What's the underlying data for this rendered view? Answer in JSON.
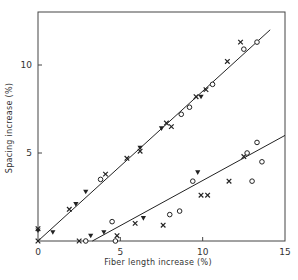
{
  "chart_data": {
    "type": "scatter",
    "title": "",
    "xlabel": "Fiber length increase (%)",
    "ylabel": "Spacing increase (%)",
    "xlim": [
      0,
      15
    ],
    "ylim": [
      0,
      13
    ],
    "x_ticks": [
      "0",
      "5",
      "10",
      "15"
    ],
    "y_ticks": [
      "5",
      "10"
    ],
    "grid": false,
    "legend": null,
    "marker_types": [
      "cross",
      "circle",
      "triangle-down"
    ],
    "series": [
      {
        "name": "upper-group",
        "points": [
          {
            "x": 0.0,
            "y": 0.0,
            "m": "cross"
          },
          {
            "x": 0.0,
            "y": 0.7,
            "m": "cross"
          },
          {
            "x": 0.0,
            "y": 0.6,
            "m": "triangle-down"
          },
          {
            "x": 0.9,
            "y": 0.5,
            "m": "triangle-down"
          },
          {
            "x": 1.9,
            "y": 1.8,
            "m": "cross"
          },
          {
            "x": 2.3,
            "y": 2.1,
            "m": "triangle-down"
          },
          {
            "x": 2.9,
            "y": 2.8,
            "m": "triangle-down"
          },
          {
            "x": 3.8,
            "y": 3.5,
            "m": "circle"
          },
          {
            "x": 4.1,
            "y": 3.8,
            "m": "cross"
          },
          {
            "x": 5.4,
            "y": 4.7,
            "m": "cross"
          },
          {
            "x": 6.2,
            "y": 5.3,
            "m": "triangle-down"
          },
          {
            "x": 6.2,
            "y": 5.1,
            "m": "cross"
          },
          {
            "x": 7.5,
            "y": 6.4,
            "m": "triangle-down"
          },
          {
            "x": 7.8,
            "y": 6.7,
            "m": "cross"
          },
          {
            "x": 8.1,
            "y": 6.5,
            "m": "cross"
          },
          {
            "x": 8.7,
            "y": 7.2,
            "m": "circle"
          },
          {
            "x": 9.2,
            "y": 7.6,
            "m": "circle"
          },
          {
            "x": 9.6,
            "y": 8.2,
            "m": "cross"
          },
          {
            "x": 9.9,
            "y": 8.2,
            "m": "triangle-down"
          },
          {
            "x": 10.2,
            "y": 8.6,
            "m": "cross"
          },
          {
            "x": 10.6,
            "y": 8.9,
            "m": "circle"
          },
          {
            "x": 11.5,
            "y": 10.2,
            "m": "cross"
          },
          {
            "x": 12.3,
            "y": 11.3,
            "m": "cross"
          },
          {
            "x": 12.5,
            "y": 10.9,
            "m": "circle"
          },
          {
            "x": 13.3,
            "y": 11.3,
            "m": "circle"
          }
        ],
        "fit_line": {
          "x": [
            0,
            14.1
          ],
          "y": [
            0,
            12.0
          ]
        }
      },
      {
        "name": "lower-group",
        "points": [
          {
            "x": 2.5,
            "y": 0.0,
            "m": "cross"
          },
          {
            "x": 2.9,
            "y": 0.0,
            "m": "circle"
          },
          {
            "x": 3.2,
            "y": 0.3,
            "m": "triangle-down"
          },
          {
            "x": 4.0,
            "y": 0.5,
            "m": "triangle-down"
          },
          {
            "x": 4.5,
            "y": 1.1,
            "m": "circle"
          },
          {
            "x": 4.7,
            "y": 0.0,
            "m": "circle"
          },
          {
            "x": 4.8,
            "y": 0.3,
            "m": "cross"
          },
          {
            "x": 5.9,
            "y": 1.0,
            "m": "cross"
          },
          {
            "x": 6.4,
            "y": 1.3,
            "m": "triangle-down"
          },
          {
            "x": 7.6,
            "y": 0.9,
            "m": "cross"
          },
          {
            "x": 8.0,
            "y": 1.5,
            "m": "circle"
          },
          {
            "x": 8.6,
            "y": 1.7,
            "m": "circle"
          },
          {
            "x": 9.4,
            "y": 3.4,
            "m": "circle"
          },
          {
            "x": 9.9,
            "y": 2.6,
            "m": "cross"
          },
          {
            "x": 10.3,
            "y": 2.6,
            "m": "cross"
          },
          {
            "x": 9.7,
            "y": 3.9,
            "m": "triangle-down"
          },
          {
            "x": 11.6,
            "y": 3.4,
            "m": "cross"
          },
          {
            "x": 12.5,
            "y": 4.8,
            "m": "cross"
          },
          {
            "x": 12.7,
            "y": 5.0,
            "m": "circle"
          },
          {
            "x": 13.0,
            "y": 3.4,
            "m": "circle"
          },
          {
            "x": 13.6,
            "y": 4.5,
            "m": "circle"
          },
          {
            "x": 13.3,
            "y": 5.6,
            "m": "circle"
          }
        ],
        "fit_line": {
          "x": [
            3.3,
            15
          ],
          "y": [
            0,
            6.0
          ]
        }
      }
    ]
  },
  "axes": {
    "xlabel": "Fiber length increase (%)",
    "ylabel": "Spacing increase (%)",
    "x_ticks": [
      "0",
      "5",
      "10",
      "15"
    ],
    "y_ticks": [
      "5",
      "10"
    ]
  }
}
